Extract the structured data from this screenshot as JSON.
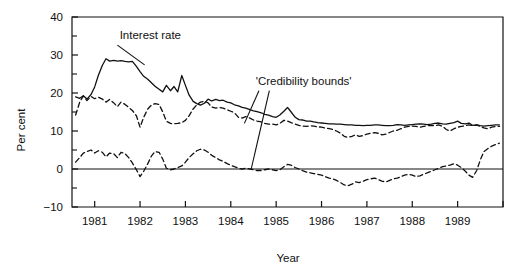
{
  "chart_data": {
    "type": "line",
    "title": "",
    "xlabel": "Year",
    "ylabel": "Per cent",
    "xlim": [
      1980.5,
      1990.0
    ],
    "ylim": [
      -10,
      40
    ],
    "yticks": [
      -10,
      0,
      10,
      20,
      30,
      40
    ],
    "ytick_labels": [
      "-10",
      "0",
      "10",
      "20",
      "30",
      "40"
    ],
    "yminor_step": 5,
    "xticks": [
      1981,
      1982,
      1983,
      1984,
      1985,
      1986,
      1987,
      1988,
      1989
    ],
    "xtick_labels": [
      "1981",
      "1982",
      "1983",
      "1984",
      "1985",
      "1986",
      "1987",
      "1988",
      "1989"
    ],
    "grid": false,
    "legend": "none",
    "zero_line": 0,
    "annotations": [
      {
        "name": "interest-rate",
        "text": "Interest rate",
        "x": 1981.55,
        "y": 34.2,
        "leader": [
          [
            1981.5,
            32.6
          ],
          [
            1982.1,
            27.4
          ]
        ]
      },
      {
        "name": "credibility-bounds",
        "text": "'Credibility bounds'",
        "x": 1984.55,
        "y": 22.2,
        "leader": [
          [
            1984.62,
            20.6
          ],
          [
            1984.3,
            12.0
          ]
        ],
        "leader2": [
          [
            1984.85,
            20.6
          ],
          [
            1984.45,
            0.0
          ]
        ]
      }
    ],
    "series": [
      {
        "name": "Interest rate",
        "style": "solid",
        "color": "#111111",
        "x": [
          1980.58,
          1980.67,
          1980.75,
          1980.83,
          1980.92,
          1981.0,
          1981.08,
          1981.17,
          1981.25,
          1981.33,
          1981.42,
          1981.5,
          1981.58,
          1981.67,
          1981.75,
          1981.83,
          1981.92,
          1982.0,
          1982.08,
          1982.17,
          1982.25,
          1982.33,
          1982.42,
          1982.5,
          1982.58,
          1982.67,
          1982.75,
          1982.83,
          1982.92,
          1983.0,
          1983.08,
          1983.17,
          1983.25,
          1983.33,
          1983.42,
          1983.5,
          1983.58,
          1983.67,
          1983.75,
          1983.83,
          1983.92,
          1984.0,
          1984.08,
          1984.17,
          1984.25,
          1984.33,
          1984.42,
          1984.5,
          1984.58,
          1984.67,
          1984.75,
          1984.83,
          1984.92,
          1985.0,
          1985.08,
          1985.17,
          1985.25,
          1985.33,
          1985.42,
          1985.5,
          1985.58,
          1985.67,
          1985.75,
          1985.83,
          1985.92,
          1986.0,
          1986.08,
          1986.17,
          1986.25,
          1986.33,
          1986.42,
          1986.5,
          1986.58,
          1986.67,
          1986.75,
          1986.83,
          1986.92,
          1987.0,
          1987.08,
          1987.17,
          1987.25,
          1987.33,
          1987.42,
          1987.5,
          1987.58,
          1987.67,
          1987.75,
          1987.83,
          1987.92,
          1988.0,
          1988.08,
          1988.17,
          1988.25,
          1988.33,
          1988.42,
          1988.5,
          1988.58,
          1988.67,
          1988.75,
          1988.83,
          1988.92,
          1989.0,
          1989.08,
          1989.17,
          1989.25,
          1989.33,
          1989.42,
          1989.5,
          1989.58,
          1989.67,
          1989.75,
          1989.83,
          1989.92
        ],
        "y": [
          19.0,
          18.6,
          19.3,
          18.4,
          19.6,
          21.6,
          24.6,
          27.3,
          29.0,
          28.4,
          28.6,
          28.4,
          28.5,
          28.3,
          28.2,
          28.3,
          27.0,
          25.6,
          24.4,
          23.6,
          22.7,
          21.8,
          21.0,
          20.3,
          22.0,
          20.6,
          21.7,
          20.3,
          24.6,
          22.0,
          19.5,
          17.8,
          17.2,
          16.8,
          17.3,
          18.4,
          17.9,
          18.3,
          18.0,
          18.1,
          17.6,
          17.4,
          16.9,
          16.6,
          16.2,
          16.0,
          15.6,
          15.3,
          15.1,
          14.8,
          14.4,
          14.2,
          13.8,
          13.6,
          14.2,
          15.2,
          16.2,
          15.0,
          13.6,
          13.0,
          12.9,
          12.6,
          12.6,
          12.4,
          12.2,
          12.1,
          12.0,
          11.9,
          11.9,
          11.8,
          11.8,
          11.7,
          11.6,
          11.6,
          11.5,
          11.5,
          11.4,
          11.5,
          11.5,
          11.6,
          11.6,
          11.5,
          11.4,
          11.4,
          11.5,
          11.7,
          11.6,
          11.5,
          11.6,
          11.7,
          11.8,
          11.9,
          11.8,
          11.7,
          11.8,
          12.0,
          12.1,
          11.9,
          11.8,
          12.0,
          12.2,
          12.6,
          12.0,
          11.9,
          12.1,
          11.5,
          11.6,
          11.4,
          11.3,
          11.4,
          11.5,
          11.6,
          11.6
        ]
      },
      {
        "name": "Upper credibility bound",
        "style": "dashed",
        "color": "#111111",
        "x": [
          1980.58,
          1980.67,
          1980.75,
          1980.83,
          1980.92,
          1981.0,
          1981.08,
          1981.17,
          1981.25,
          1981.33,
          1981.42,
          1981.5,
          1981.58,
          1981.67,
          1981.75,
          1981.83,
          1981.92,
          1982.0,
          1982.08,
          1982.17,
          1982.25,
          1982.33,
          1982.42,
          1982.5,
          1982.58,
          1982.67,
          1982.75,
          1982.83,
          1982.92,
          1983.0,
          1983.08,
          1983.17,
          1983.25,
          1983.33,
          1983.42,
          1983.5,
          1983.58,
          1983.67,
          1983.75,
          1983.83,
          1983.92,
          1984.0,
          1984.08,
          1984.17,
          1984.25,
          1984.33,
          1984.42,
          1984.5,
          1984.58,
          1984.67,
          1984.75,
          1984.83,
          1984.92,
          1985.0,
          1985.08,
          1985.17,
          1985.25,
          1985.33,
          1985.42,
          1985.5,
          1985.58,
          1985.67,
          1985.75,
          1985.83,
          1985.92,
          1986.0,
          1986.08,
          1986.17,
          1986.25,
          1986.33,
          1986.42,
          1986.5,
          1986.58,
          1986.67,
          1986.75,
          1986.83,
          1986.92,
          1987.0,
          1987.08,
          1987.17,
          1987.25,
          1987.33,
          1987.42,
          1987.5,
          1987.58,
          1987.67,
          1987.75,
          1987.83,
          1987.92,
          1988.0,
          1988.08,
          1988.17,
          1988.25,
          1988.33,
          1988.42,
          1988.5,
          1988.58,
          1988.67,
          1988.75,
          1988.83,
          1988.92,
          1989.0,
          1989.08,
          1989.17,
          1989.25,
          1989.33,
          1989.42,
          1989.5,
          1989.58,
          1989.67,
          1989.75,
          1989.83,
          1989.92
        ],
        "y": [
          14.2,
          17.6,
          19.2,
          18.0,
          19.1,
          18.5,
          18.9,
          18.4,
          17.6,
          18.3,
          17.4,
          16.4,
          17.6,
          17.0,
          16.2,
          15.4,
          14.0,
          11.0,
          13.6,
          15.8,
          16.8,
          17.2,
          17.0,
          15.0,
          12.6,
          12.0,
          11.9,
          12.0,
          12.2,
          12.8,
          14.0,
          15.8,
          16.9,
          17.6,
          17.8,
          17.4,
          16.3,
          16.0,
          16.2,
          16.0,
          15.6,
          15.2,
          14.8,
          13.6,
          13.4,
          13.8,
          13.4,
          12.9,
          12.6,
          12.4,
          12.0,
          11.8,
          11.8,
          11.6,
          12.0,
          12.8,
          12.6,
          12.2,
          11.8,
          11.5,
          11.3,
          11.2,
          11.4,
          11.3,
          11.1,
          11.0,
          10.8,
          10.6,
          10.4,
          10.0,
          9.4,
          8.6,
          8.3,
          8.6,
          9.0,
          8.6,
          8.8,
          9.2,
          9.4,
          9.6,
          9.4,
          9.0,
          9.2,
          9.6,
          10.0,
          10.2,
          10.6,
          11.0,
          11.2,
          11.3,
          11.2,
          11.0,
          11.2,
          11.4,
          11.5,
          11.4,
          11.6,
          11.2,
          10.4,
          10.0,
          10.6,
          11.0,
          11.2,
          11.4,
          11.6,
          11.4,
          11.6,
          11.2,
          10.8,
          10.6,
          11.0,
          11.2,
          11.2
        ]
      },
      {
        "name": "Lower credibility bound",
        "style": "dashed",
        "color": "#111111",
        "x": [
          1980.58,
          1980.67,
          1980.75,
          1980.83,
          1980.92,
          1981.0,
          1981.08,
          1981.17,
          1981.25,
          1981.33,
          1981.42,
          1981.5,
          1981.58,
          1981.67,
          1981.75,
          1981.83,
          1981.92,
          1982.0,
          1982.08,
          1982.17,
          1982.25,
          1982.33,
          1982.42,
          1982.5,
          1982.58,
          1982.67,
          1982.75,
          1982.83,
          1982.92,
          1983.0,
          1983.08,
          1983.17,
          1983.25,
          1983.33,
          1983.42,
          1983.5,
          1983.58,
          1983.67,
          1983.75,
          1983.83,
          1983.92,
          1984.0,
          1984.08,
          1984.17,
          1984.25,
          1984.33,
          1984.42,
          1984.5,
          1984.58,
          1984.67,
          1984.75,
          1984.83,
          1984.92,
          1985.0,
          1985.08,
          1985.17,
          1985.25,
          1985.33,
          1985.42,
          1985.5,
          1985.58,
          1985.67,
          1985.75,
          1985.83,
          1985.92,
          1986.0,
          1986.08,
          1986.17,
          1986.25,
          1986.33,
          1986.42,
          1986.5,
          1986.58,
          1986.67,
          1986.75,
          1986.83,
          1986.92,
          1987.0,
          1987.08,
          1987.17,
          1987.25,
          1987.33,
          1987.42,
          1987.5,
          1987.58,
          1987.67,
          1987.75,
          1987.83,
          1987.92,
          1988.0,
          1988.08,
          1988.17,
          1988.25,
          1988.33,
          1988.42,
          1988.5,
          1988.58,
          1988.67,
          1988.75,
          1988.83,
          1988.92,
          1989.0,
          1989.08,
          1989.17,
          1989.25,
          1989.33,
          1989.42,
          1989.5,
          1989.58,
          1989.67,
          1989.75,
          1989.83,
          1989.92
        ],
        "y": [
          1.8,
          3.0,
          4.2,
          4.6,
          5.0,
          4.2,
          4.8,
          4.4,
          3.2,
          4.2,
          4.0,
          3.0,
          4.4,
          4.0,
          3.0,
          1.6,
          -0.2,
          -2.0,
          -0.6,
          1.4,
          3.4,
          4.6,
          4.4,
          2.6,
          0.2,
          -0.2,
          0.0,
          0.4,
          0.8,
          1.8,
          3.0,
          4.0,
          4.8,
          5.2,
          5.0,
          4.4,
          3.6,
          3.0,
          2.4,
          2.0,
          1.4,
          1.0,
          0.6,
          0.2,
          0.0,
          0.2,
          0.0,
          -0.2,
          -0.4,
          -0.4,
          -0.2,
          0.0,
          -0.2,
          -0.4,
          -0.2,
          0.6,
          1.2,
          1.0,
          0.4,
          0.0,
          -0.4,
          -0.8,
          -1.0,
          -1.2,
          -1.4,
          -1.6,
          -2.0,
          -2.4,
          -2.6,
          -3.0,
          -3.6,
          -4.2,
          -4.4,
          -4.0,
          -3.4,
          -3.6,
          -3.2,
          -2.8,
          -2.6,
          -2.4,
          -2.8,
          -3.2,
          -3.4,
          -3.0,
          -2.6,
          -2.4,
          -2.0,
          -1.6,
          -1.4,
          -1.6,
          -2.0,
          -1.8,
          -1.4,
          -1.0,
          -0.6,
          -0.2,
          0.2,
          0.6,
          0.8,
          1.0,
          1.4,
          1.0,
          0.4,
          -0.6,
          -1.6,
          -2.2,
          -0.4,
          2.4,
          4.6,
          5.4,
          6.0,
          6.4,
          6.8
        ]
      }
    ]
  }
}
